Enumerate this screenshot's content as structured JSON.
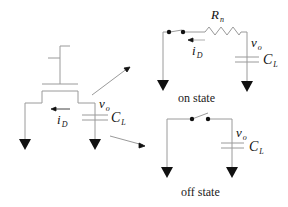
{
  "diagram": {
    "transistor": {
      "labels": {
        "current": "i",
        "current_sub": "D",
        "output": "v",
        "output_sub": "o",
        "cap": "C",
        "cap_sub": "L"
      }
    },
    "on_state": {
      "caption": "on state",
      "labels": {
        "resistor": "R",
        "resistor_sub": "n",
        "current": "i",
        "current_sub": "D",
        "output": "v",
        "output_sub": "o",
        "cap": "C",
        "cap_sub": "L"
      }
    },
    "off_state": {
      "caption": "off state",
      "labels": {
        "output": "v",
        "output_sub": "o",
        "cap": "C",
        "cap_sub": "L"
      }
    },
    "colors": {
      "wire": "#9a9a9a",
      "ink": "#111111"
    }
  }
}
